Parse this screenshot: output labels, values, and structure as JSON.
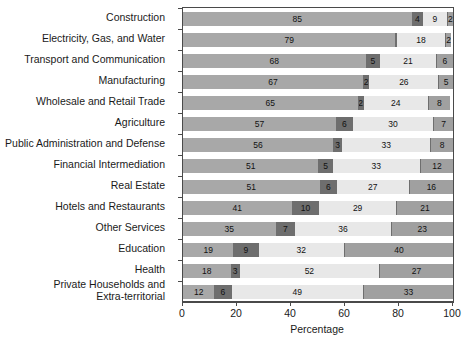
{
  "chart_data": {
    "type": "bar",
    "orientation": "horizontal",
    "stacked": true,
    "title": "",
    "xlabel": "Percentage",
    "ylabel": "",
    "xlim": [
      0,
      100
    ],
    "xticks": [
      0,
      20,
      40,
      60,
      80,
      100
    ],
    "xticklabels": [
      "0",
      "20",
      "40",
      "60",
      "80",
      "100"
    ],
    "grid": false,
    "legend": "none",
    "categories": [
      "Construction",
      "Electricity, Gas, and Water",
      "Transport and Communication",
      "Manufacturing",
      "Wholesale and Retail Trade",
      "Agriculture",
      "Public Administration and Defense",
      "Financial Intermediation",
      "Real Estate",
      "Hotels and Restaurants",
      "Other Services",
      "Education",
      "Health",
      "Private Households and\nExtra-territorial"
    ],
    "series": [
      {
        "name": "segment-1",
        "color": "#a8a8a8",
        "values": [
          85,
          79,
          68,
          67,
          65,
          57,
          56,
          51,
          51,
          41,
          35,
          19,
          18,
          12
        ]
      },
      {
        "name": "segment-2",
        "color": "#6e6e6e",
        "values": [
          4,
          0,
          5,
          2,
          2,
          6,
          3,
          5,
          6,
          10,
          7,
          9,
          3,
          6
        ]
      },
      {
        "name": "segment-3",
        "color": "#e8e8e8",
        "values": [
          9,
          18,
          21,
          26,
          24,
          30,
          33,
          33,
          27,
          29,
          36,
          32,
          52,
          49
        ]
      },
      {
        "name": "segment-4",
        "color": "#a0a0a0",
        "values": [
          2,
          2,
          6,
          5,
          8,
          7,
          8,
          12,
          16,
          21,
          23,
          40,
          27,
          33
        ]
      }
    ]
  },
  "colors": {
    "axis": "#4a4a4a",
    "frame": "#4a4a4a",
    "text": "#1a1a1a",
    "seg1": "#a8a8a8",
    "seg2": "#6e6e6e",
    "seg3": "#e8e8e8",
    "seg4": "#a0a0a0"
  }
}
